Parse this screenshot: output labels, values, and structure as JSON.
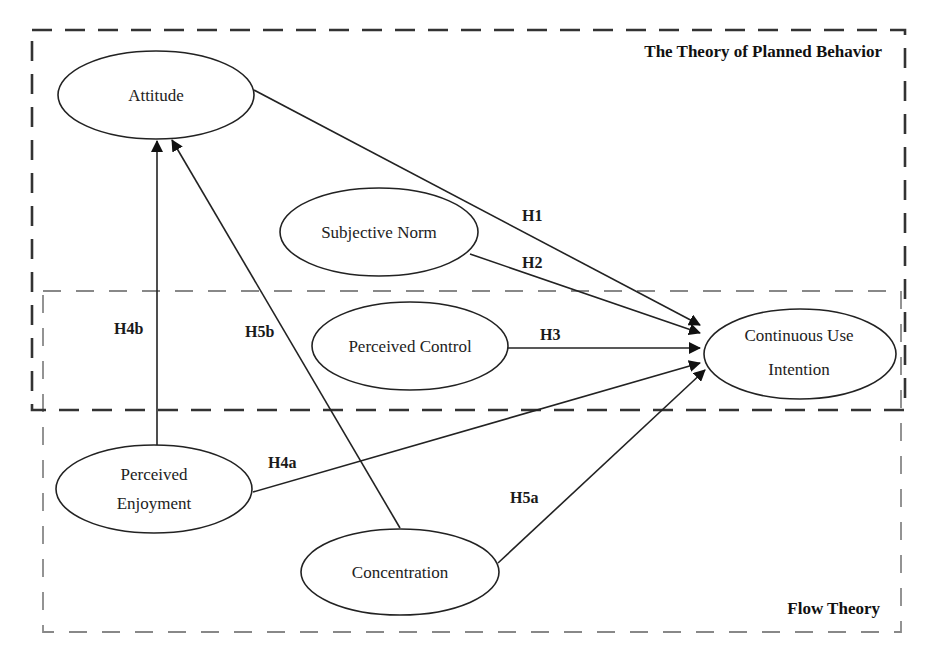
{
  "groups": {
    "tpb": {
      "label": "The Theory of Planned Behavior"
    },
    "flow": {
      "label": "Flow Theory"
    }
  },
  "nodes": {
    "attitude": {
      "label": "Attitude"
    },
    "subjective_norm": {
      "label": "Subjective Norm"
    },
    "perceived_control": {
      "label": "Perceived Control"
    },
    "continuous_use_intention": {
      "line1": "Continuous Use",
      "line2": "Intention"
    },
    "perceived_enjoyment": {
      "line1": "Perceived",
      "line2": "Enjoyment"
    },
    "concentration": {
      "label": "Concentration"
    }
  },
  "edges": {
    "h1": {
      "label": "H1",
      "from": "Attitude",
      "to": "Continuous Use Intention"
    },
    "h2": {
      "label": "H2",
      "from": "Subjective Norm",
      "to": "Continuous Use Intention"
    },
    "h3": {
      "label": "H3",
      "from": "Perceived Control",
      "to": "Continuous Use Intention"
    },
    "h4a": {
      "label": "H4a",
      "from": "Perceived Enjoyment",
      "to": "Continuous Use Intention"
    },
    "h4b": {
      "label": "H4b",
      "from": "Perceived Enjoyment",
      "to": "Attitude"
    },
    "h5a": {
      "label": "H5a",
      "from": "Concentration",
      "to": "Continuous Use Intention"
    },
    "h5b": {
      "label": "H5b",
      "from": "Concentration",
      "to": "Attitude"
    }
  },
  "colors": {
    "stroke": "#222222",
    "tpb_border": "#333333",
    "flow_border": "#888888",
    "background": "#ffffff"
  }
}
